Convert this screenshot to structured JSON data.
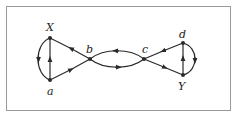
{
  "diagram": {
    "type": "directed-graph",
    "nodes": [
      {
        "id": "X",
        "label": "X",
        "x": 50,
        "y": 38,
        "label_x": 46,
        "label_y": 30
      },
      {
        "id": "a",
        "label": "a",
        "x": 50,
        "y": 80,
        "label_x": 47,
        "label_y": 95
      },
      {
        "id": "b",
        "label": "b",
        "x": 90,
        "y": 59,
        "label_x": 86,
        "label_y": 53
      },
      {
        "id": "c",
        "label": "c",
        "x": 144,
        "y": 59,
        "label_x": 143,
        "label_y": 53
      },
      {
        "id": "d",
        "label": "d",
        "x": 183,
        "y": 43,
        "label_x": 179,
        "label_y": 38
      },
      {
        "id": "Y",
        "label": "Y",
        "x": 183,
        "y": 75,
        "label_x": 178,
        "label_y": 90
      }
    ],
    "edges": [
      {
        "from": "a",
        "to": "X",
        "shape": "straight"
      },
      {
        "from": "X",
        "to": "a",
        "shape": "arc-left"
      },
      {
        "from": "b",
        "to": "X",
        "shape": "straight"
      },
      {
        "from": "a",
        "to": "b",
        "shape": "straight"
      },
      {
        "from": "c",
        "to": "b",
        "shape": "arc-upper"
      },
      {
        "from": "b",
        "to": "c",
        "shape": "arc-lower"
      },
      {
        "from": "d",
        "to": "c",
        "shape": "straight"
      },
      {
        "from": "c",
        "to": "Y",
        "shape": "straight"
      },
      {
        "from": "Y",
        "to": "d",
        "shape": "straight"
      },
      {
        "from": "d",
        "to": "Y",
        "shape": "arc-right"
      }
    ],
    "colors": {
      "stroke": "#2a2a2a",
      "frame": "#9a9a9a"
    }
  }
}
